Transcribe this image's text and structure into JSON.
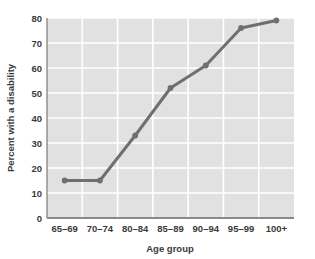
{
  "chart_data": {
    "type": "line",
    "title": "",
    "xlabel": "Age group",
    "ylabel": "Percent with a disability",
    "categories": [
      "65–69",
      "70–74",
      "80–84",
      "85–89",
      "90–94",
      "95–99",
      "100+"
    ],
    "values": [
      15,
      15,
      33,
      52,
      61,
      76,
      79
    ],
    "series": [
      {
        "name": "Percent with a disability",
        "values": [
          15,
          15,
          33,
          52,
          61,
          76,
          79
        ]
      }
    ],
    "ylim": [
      0,
      80
    ],
    "yticks": [
      0,
      10,
      20,
      30,
      40,
      50,
      60,
      70,
      80
    ],
    "ytick_labels": [
      "0",
      "10",
      "20",
      "30",
      "40",
      "50",
      "60",
      "70",
      "80"
    ],
    "xtick_labels": [
      "65–69",
      "70–74",
      "80–84",
      "85–89",
      "90–94",
      "95–99",
      "100+"
    ],
    "grid": true,
    "grid_color": "#ffffff",
    "plot_background": "#e1e1e1",
    "line_color": "#6f6f6f",
    "marker_color": "#6f6f6f",
    "axis_color": "#8a8a8a",
    "text_color": "#3a3a3a",
    "legend": null,
    "legend_position": "none"
  },
  "labels": {
    "y_axis_title": "Percent with a disability",
    "x_axis_title": "Age group",
    "y_0": "0",
    "y_10": "10",
    "y_20": "20",
    "y_30": "30",
    "y_40": "40",
    "y_50": "50",
    "y_60": "60",
    "y_70": "70",
    "y_80": "80",
    "x_0": "65–69",
    "x_1": "70–74",
    "x_2": "80–84",
    "x_3": "85–89",
    "x_4": "90–94",
    "x_5": "95–99",
    "x_6": "100+"
  }
}
